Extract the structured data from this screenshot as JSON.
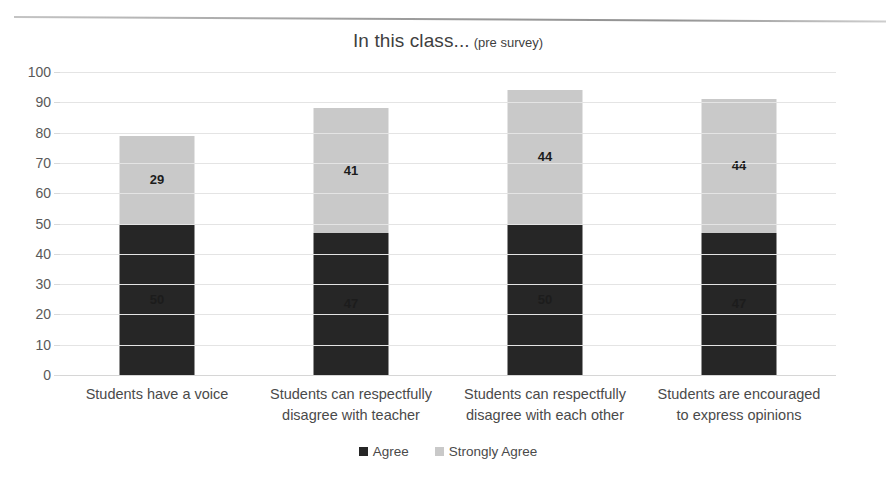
{
  "chart_data": {
    "type": "bar",
    "subtype": "stacked-column",
    "title": "In this class...",
    "title_suffix": "(pre survey)",
    "xlabel": "",
    "ylabel": "",
    "ylim": [
      0,
      100
    ],
    "ytick_step": 10,
    "yticks": [
      "100",
      "90",
      "80",
      "70",
      "60",
      "50",
      "40",
      "30",
      "20",
      "10",
      "0"
    ],
    "grid": true,
    "legend_position": "bottom-center",
    "categories": [
      "Students have a voice",
      "Students can respectfully disagree with teacher",
      "Students can respectfully disagree with each other",
      "Students are encouraged to express opinions"
    ],
    "category_lines": [
      [
        "Students have a voice"
      ],
      [
        "Students can respectfully",
        "disagree with teacher"
      ],
      [
        "Students can respectfully",
        "disagree with each other"
      ],
      [
        "Students are encouraged",
        "to express opinions"
      ]
    ],
    "series": [
      {
        "name": "Agree",
        "color": "#262626",
        "values": [
          50,
          47,
          50,
          47
        ]
      },
      {
        "name": "Strongly Agree",
        "color": "#c9c9c9",
        "values": [
          29,
          41,
          44,
          44
        ]
      }
    ],
    "totals": [
      79,
      88,
      94,
      91
    ]
  },
  "colors": {
    "agree": "#262626",
    "strongly_agree": "#c9c9c9",
    "gridline": "#e4e4e4",
    "text": "#4a4a4a",
    "background": "#ffffff"
  },
  "legend": {
    "items": [
      {
        "label": "Agree"
      },
      {
        "label": "Strongly Agree"
      }
    ]
  }
}
